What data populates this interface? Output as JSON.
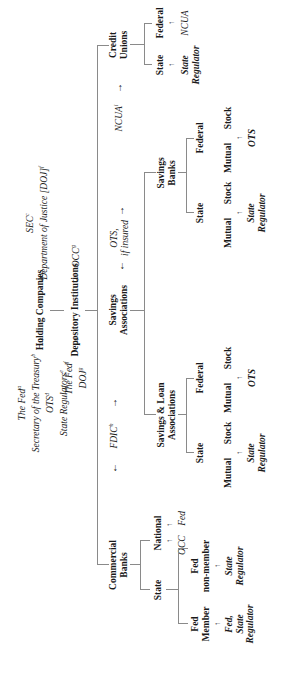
{
  "top": {
    "holding_companies": "Holding Companies",
    "depository_institutions": "Depository Institutions",
    "hc_regulators_left": [
      "The Fed",
      "Secretary of the Treasury",
      "OTS",
      "State Regulators"
    ],
    "hc_regulators_left_sup": [
      "a",
      "b",
      "d",
      "e"
    ],
    "hc_regulators_right": [
      "SEC",
      "Department of Justice [DOJ]"
    ],
    "hc_regulators_right_sup": [
      "c",
      "f"
    ],
    "di_regulators_left": [
      "The Fed",
      "DOJ"
    ],
    "di_regulators_left_sup": [
      "f",
      "g"
    ],
    "di_regulators_right": "OCC",
    "di_regulators_right_sup": "g"
  },
  "mid_regulators": {
    "fdic": "FDIC",
    "fdic_sup": "h",
    "ots_if_insured": [
      "OTS,",
      "if insured"
    ],
    "ncua": "NCUA",
    "ncua_sup": "i"
  },
  "branches": {
    "commercial_banks": {
      "label": [
        "Commercial",
        "Banks"
      ],
      "state": "State",
      "national": "National",
      "national_regulators": [
        "OCC",
        "Fed"
      ],
      "fed_member": [
        "Fed",
        "Member"
      ],
      "fed_member_regulator": [
        "Fed,",
        "State",
        "Regulator"
      ],
      "fed_nonmember": [
        "Fed",
        "non-member"
      ],
      "fed_nonmember_regulator": [
        "State",
        "Regulator"
      ]
    },
    "savings_associations": {
      "label": [
        "Savings",
        "Associations"
      ],
      "savings_loan": {
        "label": [
          "Savings & Loan",
          "Associations"
        ],
        "state": "State",
        "federal": "Federal",
        "state_children": [
          "Mutual",
          "Stock"
        ],
        "federal_children": [
          "Mutual",
          "Stock"
        ],
        "state_regulator": [
          "State",
          "Regulator"
        ],
        "federal_regulator": "OTS"
      },
      "savings_banks": {
        "label": [
          "Savings",
          "Banks"
        ],
        "state": "State",
        "federal": "Federal",
        "state_children": [
          "Mutual",
          "Stock"
        ],
        "federal_children": [
          "Mutual",
          "Stock"
        ],
        "state_regulator": [
          "State",
          "Regulator"
        ],
        "federal_regulator": "OTS"
      }
    },
    "credit_unions": {
      "label": [
        "Credit",
        "Unions"
      ],
      "state": "State",
      "federal": "Federal",
      "state_regulator": [
        "State",
        "Regulator"
      ],
      "federal_regulator": "NCUA"
    }
  },
  "arrows": {
    "up": "↑",
    "down": "↓",
    "thin_up": "↑"
  }
}
